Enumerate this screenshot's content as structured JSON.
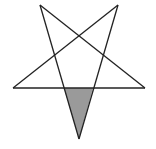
{
  "figure": {
    "stroke_color": "#222222",
    "shade_color": "#9a9a9a",
    "background": "#ffffff",
    "vertices": {
      "top_left": [
        40,
        5
      ],
      "top_right": [
        118,
        5
      ],
      "left": [
        13,
        88
      ],
      "right": [
        145,
        88
      ],
      "bottom": [
        79,
        139
      ]
    },
    "shaded_region": [
      [
        64,
        88
      ],
      [
        93,
        88
      ],
      [
        79,
        139
      ]
    ]
  }
}
